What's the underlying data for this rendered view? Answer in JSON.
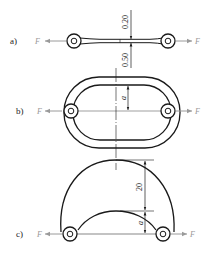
{
  "figure": {
    "panels": [
      {
        "id": "a",
        "label": "a)",
        "force_left": "F",
        "force_right": "F",
        "dimensions": [
          "0.20",
          "0.50"
        ]
      },
      {
        "id": "b",
        "label": "b)",
        "force_left": "F",
        "force_right": "F",
        "dimensions": [
          "a"
        ]
      },
      {
        "id": "c",
        "label": "c)",
        "force_left": "F",
        "force_right": "F",
        "dimensions": [
          "20",
          "a"
        ]
      }
    ],
    "colors": {
      "line": "#1a1a1a",
      "force_arrow": "#9a9a9a"
    }
  }
}
